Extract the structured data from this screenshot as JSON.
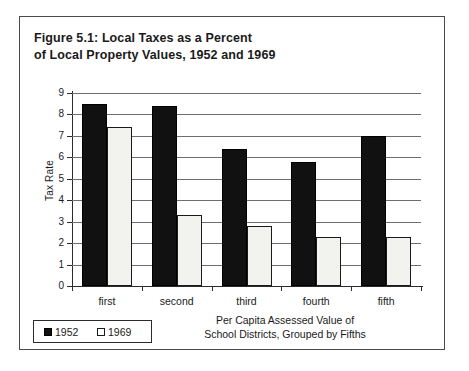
{
  "figure": {
    "title_line1": "Figure 5.1: Local Taxes as a Percent",
    "title_line2": "of Local Property Values, 1952 and 1969"
  },
  "legend": {
    "entries": [
      {
        "label": "1952",
        "swatch": "filled-square-icon",
        "color": "#111111"
      },
      {
        "label": "1969",
        "swatch": "hollow-square-icon",
        "color": "#ffffff"
      }
    ]
  },
  "axes": {
    "y_title": "Tax Rate",
    "y_ticks": [
      "0",
      "1",
      "2",
      "3",
      "4",
      "5",
      "6",
      "7",
      "8",
      "9"
    ],
    "x_title_line1": "Per Capita Assessed Value of",
    "x_title_line2": "School Districts, Grouped by Fifths"
  },
  "chart_data": {
    "type": "bar",
    "title": "Figure 5.1: Local Taxes as a Percent of Local Property Values, 1952 and 1969",
    "xlabel": "Per Capita Assessed Value of School Districts, Grouped by Fifths",
    "ylabel": "Tax Rate",
    "categories": [
      "first",
      "second",
      "third",
      "fourth",
      "fifth"
    ],
    "series": [
      {
        "name": "1952",
        "color": "#111111",
        "values": [
          8.5,
          8.4,
          6.4,
          5.8,
          7.0
        ]
      },
      {
        "name": "1969",
        "color": "#f2f2ef",
        "values": [
          7.4,
          3.3,
          2.8,
          2.3,
          2.3
        ]
      }
    ],
    "ylim": [
      0,
      9
    ],
    "ytick_step": 1,
    "grid": "horizontal",
    "legend_position": "bottom-left"
  }
}
